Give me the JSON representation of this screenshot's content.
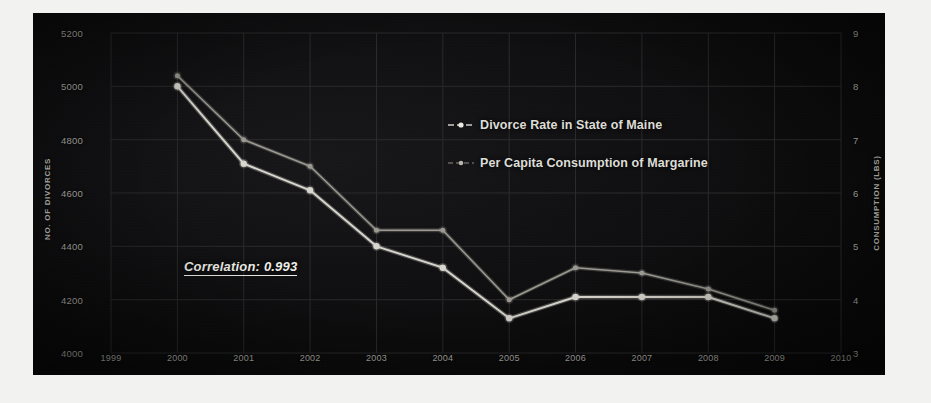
{
  "chart_data": {
    "type": "line",
    "title": "",
    "subtitle": "",
    "xlabel": "",
    "ylabel": "NO. OF DIVORCES",
    "y2label": "CONSUMPTION (LBS)",
    "x": [
      1999,
      2000,
      2001,
      2002,
      2003,
      2004,
      2005,
      2006,
      2007,
      2008,
      2009,
      2010
    ],
    "xtick_labels": [
      "1999",
      "2000",
      "2001",
      "2002",
      "2003",
      "2004",
      "2005",
      "2006",
      "2007",
      "2008",
      "2009",
      "2010"
    ],
    "xlim": [
      1999,
      2010
    ],
    "ylim": [
      4000,
      5200
    ],
    "ytick_labels": [
      "5200",
      "5000",
      "4800",
      "4600",
      "4400",
      "4200",
      "4000"
    ],
    "ytick_values": [
      5200,
      5000,
      4800,
      4600,
      4400,
      4200,
      4000
    ],
    "y2lim": [
      3,
      9
    ],
    "y2tick_labels": [
      "9",
      "8",
      "7",
      "6",
      "5",
      "4",
      "3"
    ],
    "y2tick_values": [
      9,
      8,
      7,
      6,
      5,
      4,
      3
    ],
    "grid": true,
    "legend_position": "center",
    "series": [
      {
        "name": "Divorce Rate in State of Maine",
        "axis": "left",
        "x": [
          2000,
          2001,
          2002,
          2003,
          2004,
          2005,
          2006,
          2007,
          2008,
          2009
        ],
        "values": [
          5000,
          4710,
          4610,
          4400,
          4320,
          4130,
          4210,
          4210,
          4210,
          4130
        ],
        "color": "#d8d6ce",
        "marker": "circle"
      },
      {
        "name": "Per Capita Consumption of Margarine",
        "axis": "right",
        "x": [
          2000,
          2001,
          2002,
          2003,
          2004,
          2005,
          2006,
          2007,
          2008,
          2009
        ],
        "values": [
          8.2,
          7.0,
          6.5,
          5.3,
          5.3,
          4.0,
          4.6,
          4.5,
          4.2,
          3.8
        ],
        "color": "#9b9991",
        "marker": "circle"
      }
    ],
    "annotations": [
      {
        "name": "correlation-annotation",
        "text": "Correlation: 0.993",
        "style": "bold-italic-underline"
      }
    ]
  },
  "legend": {
    "items": [
      {
        "label": "Divorce Rate in State of Maine",
        "marker": "line-dot-marker"
      },
      {
        "label": "Per Capita Consumption of Margarine",
        "marker": "line-dot-marker"
      }
    ]
  },
  "colors": {
    "panel_background": "#0d0d0e",
    "page_background": "#f2f2f0",
    "text": "#b9b7b0",
    "series_primary": "#d8d6ce",
    "series_secondary": "#9b9991",
    "gridline": "#2a2a2c"
  }
}
